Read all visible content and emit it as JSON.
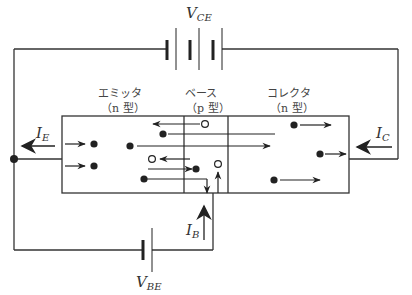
{
  "diagram": {
    "type": "transistor-npn-carrier-flow",
    "colors": {
      "line": "#333333",
      "background": "#ffffff"
    },
    "labels": {
      "v_ce": {
        "main": "V",
        "sub": "CE"
      },
      "v_be": {
        "main": "V",
        "sub": "BE"
      },
      "i_e": {
        "main": "I",
        "sub": "E"
      },
      "i_c": {
        "main": "I",
        "sub": "C"
      },
      "i_b": {
        "main": "I",
        "sub": "B"
      }
    },
    "regions": [
      {
        "name": "エミッタ",
        "type": "（n 型）"
      },
      {
        "name": "ベース",
        "type": "（p 型）"
      },
      {
        "name": "コレクタ",
        "type": "（n 型）"
      }
    ],
    "legend": {
      "electron": "filled-dot",
      "hole": "open-circle"
    }
  }
}
